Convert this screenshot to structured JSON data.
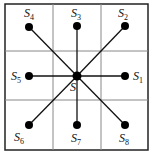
{
  "diagram": {
    "type": "3x3 grid neighborhood",
    "grid": {
      "rows": 3,
      "cols": 3
    },
    "center": {
      "label": "S",
      "subscript": ""
    },
    "nodes": [
      {
        "id": "S1",
        "label": "S",
        "subscript": "1",
        "position": "east"
      },
      {
        "id": "S2",
        "label": "S",
        "subscript": "2",
        "position": "north-east"
      },
      {
        "id": "S3",
        "label": "S",
        "subscript": "3",
        "position": "north"
      },
      {
        "id": "S4",
        "label": "S",
        "subscript": "4",
        "position": "north-west"
      },
      {
        "id": "S5",
        "label": "S",
        "subscript": "5",
        "position": "west"
      },
      {
        "id": "S6",
        "label": "S",
        "subscript": "6",
        "position": "south-west"
      },
      {
        "id": "S7",
        "label": "S",
        "subscript": "7",
        "position": "south"
      },
      {
        "id": "S8",
        "label": "S",
        "subscript": "8",
        "position": "south-east"
      }
    ],
    "colors": {
      "grid": "#888888",
      "border": "#222222",
      "node": "#000000",
      "edge": "#111111"
    }
  }
}
